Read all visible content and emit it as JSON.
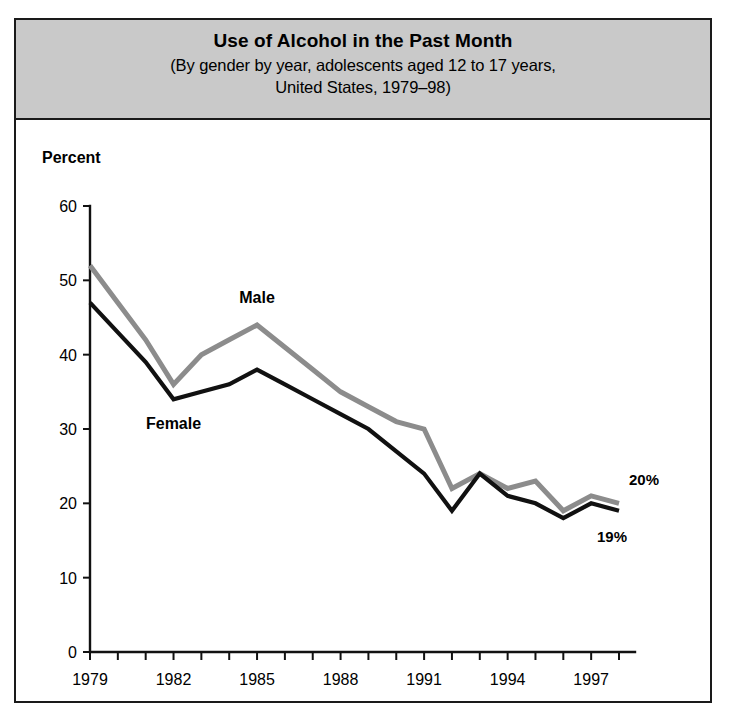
{
  "figure": {
    "title": "Use of Alcohol in the Past Month",
    "subtitle_line1": "(By gender by year, adolescents aged 12 to 17 years,",
    "subtitle_line2": "United States, 1979–98)",
    "axis_title": "Percent",
    "header_bg": "#c9c9c9",
    "frame_color": "#1a1a1a"
  },
  "chart_data": {
    "type": "line",
    "title": "Use of Alcohol in the Past Month",
    "subtitle": "(By gender by year, adolescents aged 12 to 17 years, United States, 1979–98)",
    "xlabel": "",
    "ylabel": "Percent",
    "xlim": [
      1979,
      1998
    ],
    "ylim": [
      0,
      60
    ],
    "yticks": [
      0,
      10,
      20,
      30,
      40,
      50,
      60
    ],
    "xticks": [
      1979,
      1980,
      1981,
      1982,
      1983,
      1984,
      1985,
      1986,
      1987,
      1988,
      1989,
      1990,
      1991,
      1992,
      1993,
      1994,
      1995,
      1996,
      1997,
      1998
    ],
    "xtick_labels_shown": [
      "1979",
      "1982",
      "1985",
      "1988",
      "1991",
      "1994",
      "1997"
    ],
    "xtick_labels_shown_at": [
      1979,
      1982,
      1985,
      1988,
      1991,
      1994,
      1997
    ],
    "grid": false,
    "legend": "inline-labels",
    "x": [
      1979,
      1980,
      1981,
      1982,
      1983,
      1984,
      1985,
      1986,
      1987,
      1988,
      1989,
      1990,
      1991,
      1992,
      1993,
      1994,
      1995,
      1996,
      1997,
      1998
    ],
    "series": [
      {
        "name": "Male",
        "color": "#8c8c8c",
        "label_x": 1985,
        "label_y": 47,
        "endpoint_label": "20%",
        "values": [
          52,
          47,
          42,
          36,
          40,
          42,
          44,
          41,
          38,
          35,
          33,
          31,
          30,
          22,
          24,
          22,
          23,
          19,
          21,
          20
        ]
      },
      {
        "name": "Female",
        "color": "#111111",
        "label_x": 1982,
        "label_y": 30,
        "endpoint_label": "19%",
        "values": [
          47,
          43,
          39,
          34,
          35,
          36,
          38,
          36,
          34,
          32,
          30,
          27,
          24,
          19,
          24,
          21,
          20,
          18,
          20,
          19
        ]
      }
    ],
    "annotations": [
      {
        "text": "Male",
        "kind": "series-label"
      },
      {
        "text": "Female",
        "kind": "series-label"
      },
      {
        "text": "20%",
        "kind": "endpoint-label"
      },
      {
        "text": "19%",
        "kind": "endpoint-label"
      }
    ]
  }
}
